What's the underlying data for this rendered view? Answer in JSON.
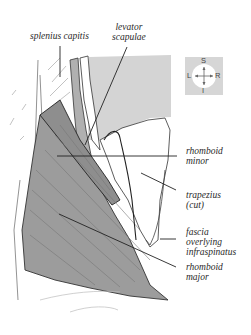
{
  "figure": {
    "type": "anatomical-illustration",
    "colors": {
      "muscle_fill": "#9c9c9c",
      "background_fill": "#d4d4d4",
      "outline": "#222222",
      "leader_line": "#222222"
    }
  },
  "labels": {
    "splenius_capitis": "splenius capitis",
    "levator_scapulae_1": "levator",
    "levator_scapulae_2": "scapulae",
    "rhomboid_minor_1": "rhomboid",
    "rhomboid_minor_2": "minor",
    "trapezius_1": "trapezius",
    "trapezius_2": "(cut)",
    "fascia_1": "fascia",
    "fascia_2": "overlying",
    "fascia_3": "infraspinatus",
    "rhomboid_major_1": "rhomboid",
    "rhomboid_major_2": "major"
  },
  "compass": {
    "superior": "S",
    "inferior": "I",
    "left": "L",
    "right": "R"
  }
}
